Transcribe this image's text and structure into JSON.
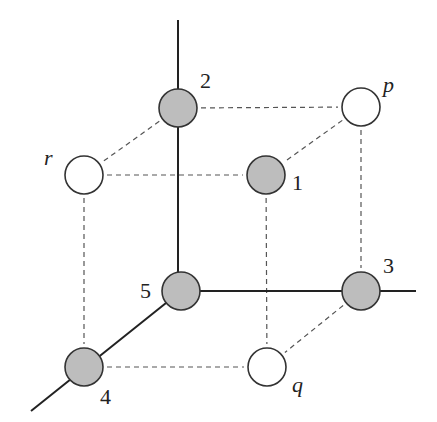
{
  "diagram": {
    "colors": {
      "filled_node": "#bdbdbd",
      "open_node": "#ffffff",
      "stroke": "#333333",
      "axis": "#222222",
      "dashed": "#555555"
    },
    "nodes": [
      {
        "id": "2",
        "label": "2",
        "x": 178,
        "y": 108,
        "filled": true,
        "label_x": 200,
        "label_y": 88,
        "italic": false
      },
      {
        "id": "p",
        "label": "p",
        "x": 361,
        "y": 107,
        "filled": false,
        "label_x": 383,
        "label_y": 92,
        "italic": true
      },
      {
        "id": "r",
        "label": "r",
        "x": 84,
        "y": 175,
        "filled": false,
        "label_x": 44,
        "label_y": 165,
        "italic": true
      },
      {
        "id": "1",
        "label": "1",
        "x": 266,
        "y": 175,
        "filled": true,
        "label_x": 292,
        "label_y": 190,
        "italic": false
      },
      {
        "id": "5",
        "label": "5",
        "x": 181,
        "y": 291,
        "filled": true,
        "label_x": 140,
        "label_y": 298,
        "italic": false
      },
      {
        "id": "3",
        "label": "3",
        "x": 361,
        "y": 291,
        "filled": true,
        "label_x": 383,
        "label_y": 273,
        "italic": false
      },
      {
        "id": "4",
        "label": "4",
        "x": 84,
        "y": 367,
        "filled": true,
        "label_x": 100,
        "label_y": 404,
        "italic": false
      },
      {
        "id": "q",
        "label": "q",
        "x": 267,
        "y": 367,
        "filled": false,
        "label_x": 292,
        "label_y": 392,
        "italic": true
      }
    ],
    "axes": [
      {
        "name": "vertical-axis",
        "x1": 178,
        "y1": 20,
        "x2": 178,
        "y2": 291
      },
      {
        "name": "horizontal-axis",
        "x1": 181,
        "y1": 291,
        "x2": 416,
        "y2": 291
      },
      {
        "name": "diagonal-axis",
        "x1": 181,
        "y1": 291,
        "x2": 31,
        "y2": 411
      }
    ],
    "dashed_edges": [
      {
        "from": "2",
        "to": "p"
      },
      {
        "from": "2",
        "to": "r"
      },
      {
        "from": "r",
        "to": "1"
      },
      {
        "from": "p",
        "to": "1"
      },
      {
        "from": "r",
        "to": "4"
      },
      {
        "from": "1",
        "to": "q"
      },
      {
        "from": "p",
        "to": "3"
      },
      {
        "from": "4",
        "to": "q"
      },
      {
        "from": "3",
        "to": "q"
      }
    ],
    "node_radius": 19
  }
}
